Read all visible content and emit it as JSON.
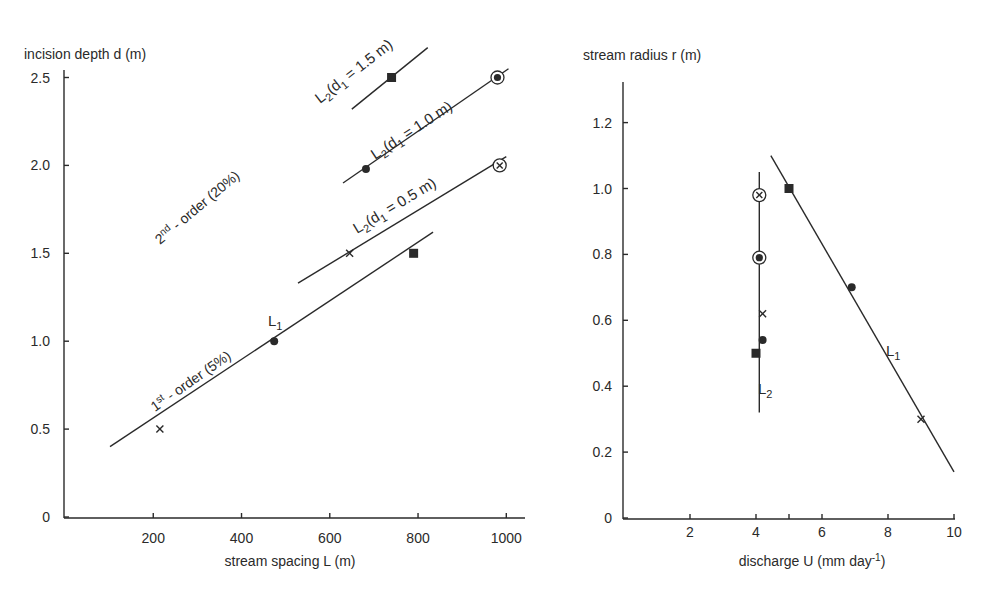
{
  "chart_data": [
    {
      "type": "line",
      "panel": "left",
      "title": "",
      "ylabel": "incision depth d (m)",
      "xlabel": "stream spacing L (m)",
      "xlim": [
        0,
        1050
      ],
      "ylim": [
        0,
        2.6
      ],
      "xticks": [
        "200",
        "400",
        "600",
        "800",
        "1000"
      ],
      "yticks": [
        "0",
        "0.5",
        "1.0",
        "1.5",
        "2.0",
        "2.5"
      ],
      "grid": false,
      "annotations": [
        {
          "text": "2nd - order (20%)",
          "base": "2",
          "sup": "nd",
          "rest": " - order (20%)"
        },
        {
          "text": "1st - order (5%)",
          "base": "1",
          "sup": "st",
          "rest": " - order (5%)"
        }
      ],
      "series": [
        {
          "name": "L1",
          "label_main": "L",
          "label_sub": "1",
          "line": [
            [
              102,
              0.4
            ],
            [
              834,
              1.62
            ]
          ],
          "points": [
            {
              "x": 215,
              "y": 0.5,
              "marker": "cross"
            },
            {
              "x": 474,
              "y": 1.0,
              "marker": "dot"
            },
            {
              "x": 790,
              "y": 1.5,
              "marker": "square"
            }
          ]
        },
        {
          "name": "L2 (d1 = 0.5 m)",
          "label_main": "L",
          "label_sub": "2",
          "label_rest": "(d",
          "label_sub2": "1",
          "label_end": " = 0.5 m)",
          "line": [
            [
              528,
              1.33
            ],
            [
              1000,
              2.05
            ]
          ],
          "points": [
            {
              "x": 645,
              "y": 1.5,
              "marker": "cross"
            },
            {
              "x": 985,
              "y": 2.0,
              "marker": "circled-cross"
            }
          ]
        },
        {
          "name": "L2 (d1 = 1.0 m)",
          "label_main": "L",
          "label_sub": "2",
          "label_rest": "(d",
          "label_sub2": "1",
          "label_end": " = 1.0 m)",
          "line": [
            [
              630,
              1.9
            ],
            [
              1005,
              2.55
            ]
          ],
          "points": [
            {
              "x": 682,
              "y": 1.98,
              "marker": "dot"
            },
            {
              "x": 980,
              "y": 2.5,
              "marker": "circled-dot"
            }
          ]
        },
        {
          "name": "L2 (d1 = 1.5 m)",
          "label_main": "L",
          "label_sub": "2",
          "label_rest": "(d",
          "label_sub2": "1",
          "label_end": " = 1.5 m)",
          "line": [
            [
              650,
              2.32
            ],
            [
              822,
              2.67
            ]
          ],
          "points": [
            {
              "x": 740,
              "y": 2.5,
              "marker": "square"
            }
          ]
        }
      ]
    },
    {
      "type": "line",
      "panel": "right",
      "title": "",
      "ylabel": "stream radius r (m)",
      "xlabel": "discharge U (mm day-1)",
      "xlabel_main": "discharge U (mm day",
      "xlabel_sup": "-1",
      "xlabel_end": ")",
      "xlim": [
        0,
        10.2
      ],
      "ylim": [
        0,
        1.32
      ],
      "xticks": [
        "2",
        "4",
        "6",
        "8",
        "10"
      ],
      "yticks": [
        "0",
        "0.2",
        "0.4",
        "0.6",
        "0.8",
        "1.0",
        "1.2"
      ],
      "grid": false,
      "series": [
        {
          "name": "L1",
          "label_main": "L",
          "label_sub": "1",
          "line": [
            [
              4.45,
              1.1
            ],
            [
              10.0,
              0.14
            ]
          ],
          "points": [
            {
              "x": 5.0,
              "y": 1.0,
              "marker": "square"
            },
            {
              "x": 6.9,
              "y": 0.7,
              "marker": "dot"
            },
            {
              "x": 9.0,
              "y": 0.3,
              "marker": "cross"
            }
          ]
        },
        {
          "name": "L2",
          "label_main": "L",
          "label_sub": "2",
          "line": [
            [
              4.1,
              1.05
            ],
            [
              4.1,
              0.32
            ]
          ],
          "points": [
            {
              "x": 4.1,
              "y": 0.98,
              "marker": "circled-cross"
            },
            {
              "x": 4.1,
              "y": 0.79,
              "marker": "circled-dot"
            },
            {
              "x": 4.2,
              "y": 0.62,
              "marker": "cross"
            },
            {
              "x": 4.2,
              "y": 0.54,
              "marker": "dot"
            },
            {
              "x": 4.0,
              "y": 0.5,
              "marker": "square"
            }
          ]
        }
      ]
    }
  ]
}
